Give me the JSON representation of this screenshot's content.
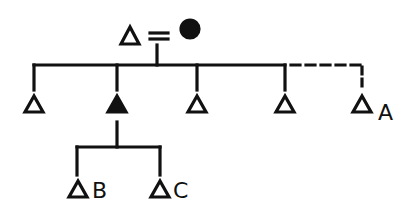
{
  "diagram": {
    "type": "kinship-chart",
    "ink_color": "#111111",
    "background": "#ffffff",
    "parents": {
      "father": {
        "symbol": "male-triangle",
        "filled": false
      },
      "marriage_symbol": "=",
      "mother": {
        "symbol": "female-circle",
        "filled": true
      }
    },
    "children": [
      {
        "id": "child-1",
        "symbol": "male-triangle",
        "filled": false,
        "label": ""
      },
      {
        "id": "child-2-ego",
        "symbol": "male-triangle",
        "filled": true,
        "label": ""
      },
      {
        "id": "child-3",
        "symbol": "male-triangle",
        "filled": false,
        "label": ""
      },
      {
        "id": "child-4",
        "symbol": "male-triangle",
        "filled": false,
        "label": ""
      },
      {
        "id": "child-5",
        "symbol": "male-triangle",
        "filled": false,
        "label": "A",
        "link": "dashed"
      }
    ],
    "grandchildren": [
      {
        "id": "grandchild-b",
        "symbol": "male-triangle",
        "filled": false,
        "label": "B"
      },
      {
        "id": "grandchild-c",
        "symbol": "male-triangle",
        "filled": false,
        "label": "C"
      }
    ]
  }
}
